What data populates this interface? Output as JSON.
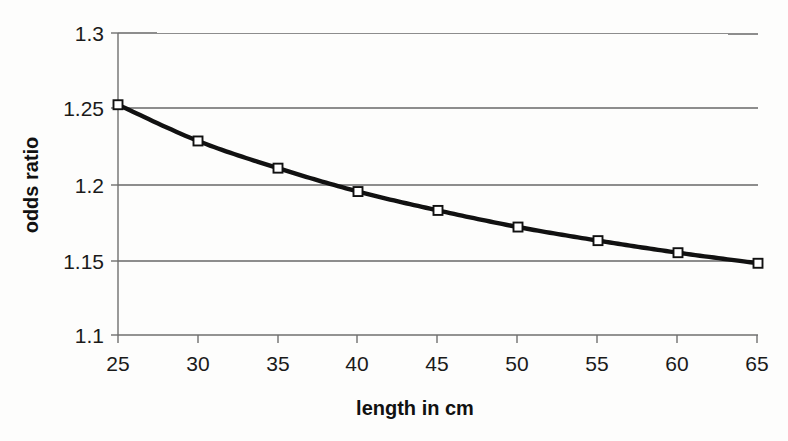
{
  "chart_data": {
    "type": "line",
    "title": "",
    "xlabel": "length in cm",
    "ylabel": "odds ratio",
    "x": [
      25,
      30,
      35,
      40,
      45,
      50,
      55,
      60,
      65
    ],
    "values": [
      1.2525,
      1.2285,
      1.2105,
      1.195,
      1.1825,
      1.1715,
      1.1625,
      1.1545,
      1.1475
    ],
    "series": [
      {
        "name": "odds ratio",
        "values": [
          1.2525,
          1.2285,
          1.2105,
          1.195,
          1.1825,
          1.1715,
          1.1625,
          1.1545,
          1.1475
        ]
      }
    ],
    "xlim": [
      25,
      65
    ],
    "ylim": [
      1.1,
      1.3
    ],
    "xticks": [
      25,
      30,
      35,
      40,
      45,
      50,
      55,
      60,
      65
    ],
    "yticks": [
      1.1,
      1.15,
      1.2,
      1.25,
      1.3
    ],
    "xtick_labels": [
      "25",
      "30",
      "35",
      "40",
      "45",
      "50",
      "55",
      "60",
      "65"
    ],
    "ytick_labels": [
      "1.1",
      "1.15",
      "1.2",
      "1.25",
      "1.3"
    ],
    "grid": "horizontal",
    "legend": "none",
    "marker": "open-square",
    "line_color": "#111111",
    "marker_fill": "#ffffff",
    "grid_color": "#8d8d8d",
    "background": "#fdfdfc"
  }
}
